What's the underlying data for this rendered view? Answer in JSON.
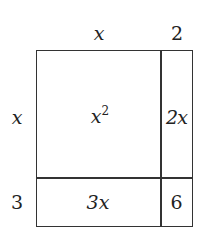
{
  "diagram": {
    "type": "area-model",
    "top_labels": [
      "x",
      "2"
    ],
    "side_labels": [
      "x",
      "3"
    ],
    "cells": {
      "top_left": {
        "base": "x",
        "exp": "2"
      },
      "top_right": "2x",
      "bottom_left": "3x",
      "bottom_right": "6"
    },
    "line_color": "#333333"
  }
}
